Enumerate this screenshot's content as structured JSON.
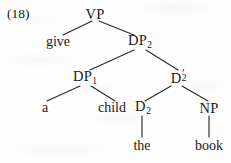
{
  "figure": {
    "example_number": "(18)",
    "kind": "syntax-tree",
    "sentence": "give a child the book"
  },
  "tree": {
    "nodes": [
      {
        "id": "vp",
        "label": "VP",
        "sub": "",
        "prime": false,
        "x": 95,
        "y": 14,
        "type": "category"
      },
      {
        "id": "give",
        "label": "give",
        "sub": "",
        "prime": false,
        "x": 58,
        "y": 42,
        "type": "terminal"
      },
      {
        "id": "dp2",
        "label": "DP",
        "sub": "2",
        "prime": false,
        "x": 140,
        "y": 42,
        "type": "category"
      },
      {
        "id": "dp1",
        "label": "DP",
        "sub": "1",
        "prime": false,
        "x": 85,
        "y": 78,
        "type": "category"
      },
      {
        "id": "d2bar",
        "label": "D",
        "sub": "2",
        "prime": true,
        "x": 176,
        "y": 78,
        "type": "category"
      },
      {
        "id": "a",
        "label": "a",
        "sub": "",
        "prime": false,
        "x": 45,
        "y": 108,
        "type": "terminal"
      },
      {
        "id": "child",
        "label": "child",
        "sub": "",
        "prime": false,
        "x": 112,
        "y": 108,
        "type": "terminal"
      },
      {
        "id": "d2",
        "label": "D",
        "sub": "2",
        "prime": false,
        "x": 143,
        "y": 108,
        "type": "category"
      },
      {
        "id": "np",
        "label": "NP",
        "sub": "",
        "prime": false,
        "x": 209,
        "y": 108,
        "type": "category"
      },
      {
        "id": "the",
        "label": "the",
        "sub": "",
        "prime": false,
        "x": 142,
        "y": 146,
        "type": "terminal"
      },
      {
        "id": "book",
        "label": "book",
        "sub": "",
        "prime": false,
        "x": 209,
        "y": 146,
        "type": "terminal"
      }
    ],
    "edges": [
      {
        "from": "vp",
        "to": "give",
        "x1": 92,
        "y1": 21,
        "x2": 63,
        "y2": 35
      },
      {
        "from": "vp",
        "to": "dp2",
        "x1": 99,
        "y1": 21,
        "x2": 134,
        "y2": 35
      },
      {
        "from": "dp2",
        "to": "dp1",
        "x1": 134,
        "y1": 50,
        "x2": 90,
        "y2": 70
      },
      {
        "from": "dp2",
        "to": "d2bar",
        "x1": 146,
        "y1": 50,
        "x2": 178,
        "y2": 70
      },
      {
        "from": "dp1",
        "to": "a",
        "x1": 80,
        "y1": 86,
        "x2": 47,
        "y2": 101
      },
      {
        "from": "dp1",
        "to": "child",
        "x1": 91,
        "y1": 86,
        "x2": 115,
        "y2": 101
      },
      {
        "from": "d2bar",
        "to": "d2",
        "x1": 171,
        "y1": 86,
        "x2": 145,
        "y2": 101
      },
      {
        "from": "d2bar",
        "to": "np",
        "x1": 182,
        "y1": 86,
        "x2": 208,
        "y2": 101
      },
      {
        "from": "d2",
        "to": "the",
        "x1": 142,
        "y1": 116,
        "x2": 142,
        "y2": 137
      },
      {
        "from": "np",
        "to": "book",
        "x1": 209,
        "y1": 116,
        "x2": 209,
        "y2": 137
      }
    ],
    "stroke_color": "#2b2b2b"
  }
}
